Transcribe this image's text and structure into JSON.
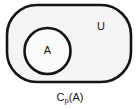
{
  "diagram": {
    "type": "venn-set-diagram",
    "universal_set": {
      "label": "U",
      "shape": "rounded-rectangle",
      "label_x": 101,
      "label_y": 27,
      "fill": "#f4f4f4",
      "stroke": "#141414",
      "stroke_width": 2.6,
      "x": 7,
      "y": 5,
      "width": 124,
      "height": 77,
      "corner_radius": 30
    },
    "subset": {
      "label": "A",
      "shape": "circle",
      "label_x": 47.5,
      "label_y": 51,
      "fill": "#fbfbfb",
      "stroke": "#141414",
      "stroke_width": 2.6,
      "cx": 47.5,
      "cy": 51,
      "r": 23
    },
    "caption": {
      "base": "C",
      "subscript": "p",
      "argument": "(A)",
      "full": "Cp(A)",
      "x": 70,
      "y": 101
    },
    "colors": {
      "background": "#ffffff",
      "ink": "#141414",
      "universe_fill": "#f4f4f4",
      "subset_fill": "#fbfbfb"
    }
  }
}
